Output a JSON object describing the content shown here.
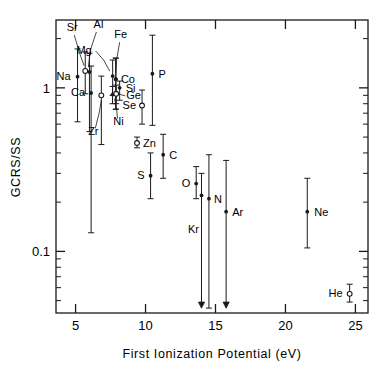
{
  "figure": {
    "domain": "chart",
    "background_color": "#ffffff",
    "ink_color": "#1a1a1a"
  },
  "chart_data": {
    "type": "scatter",
    "title": "",
    "xlabel": "First Ionization Potential (eV)",
    "ylabel": "GCRS/SS",
    "xscale": "linear",
    "yscale": "log",
    "xlim": [
      3.6,
      25.9
    ],
    "ylim": [
      0.042,
      2.6
    ],
    "xticks": [
      5,
      10,
      15,
      20,
      25
    ],
    "xtick_labels": [
      "5",
      "10",
      "15",
      "20",
      "25"
    ],
    "yticks": [
      1,
      0.1
    ],
    "ytick_labels": [
      "1",
      "0.1"
    ],
    "yminor_decades": [
      1,
      0.1
    ],
    "grid": false,
    "legend": false,
    "error_bars": "vertical",
    "points": [
      {
        "label": "Na",
        "x": 5.14,
        "y": 1.17,
        "ylo": 0.62,
        "yhi": 1.73,
        "marker": "filled",
        "label_pos": "left"
      },
      {
        "label": "Sr",
        "x": 5.69,
        "y": 1.27,
        "ylo": 0.92,
        "yhi": 1.66,
        "marker": "open",
        "label_pos": "leader-up-left"
      },
      {
        "label": "Al",
        "x": 5.99,
        "y": 1.25,
        "ylo": 0.54,
        "yhi": 1.63,
        "marker": "filled",
        "label_pos": "leader-up"
      },
      {
        "label": "Ca",
        "x": 6.11,
        "y": 0.93,
        "ylo": 0.13,
        "yhi": 1.36,
        "marker": "filled",
        "label_pos": "left"
      },
      {
        "label": "Mg",
        "x": 7.65,
        "y": 1.18,
        "ylo": 0.9,
        "yhi": 1.48,
        "marker": "filled",
        "label_pos": "leader-left"
      },
      {
        "label": "Zr",
        "x": 6.84,
        "y": 0.9,
        "ylo": 0.45,
        "yhi": 1.18,
        "marker": "open",
        "label_pos": "leader-down-left"
      },
      {
        "label": "Fe",
        "x": 7.87,
        "y": 1.13,
        "ylo": 0.74,
        "yhi": 1.52,
        "marker": "filled",
        "label_pos": "leader-up"
      },
      {
        "label": "Co",
        "x": 7.88,
        "y": 1.13,
        "ylo": 0.74,
        "yhi": 1.52,
        "marker": "filled",
        "label_pos": "right"
      },
      {
        "label": "Si",
        "x": 8.15,
        "y": 1.0,
        "ylo": 0.84,
        "yhi": 1.1,
        "marker": "filled",
        "label_pos": "right"
      },
      {
        "label": "Ni",
        "x": 7.64,
        "y": 0.91,
        "ylo": 0.8,
        "yhi": 1.02,
        "marker": "filled",
        "label_pos": "leader-down"
      },
      {
        "label": "Ge",
        "x": 7.9,
        "y": 0.92,
        "ylo": 0.8,
        "yhi": 1.04,
        "marker": "open",
        "label_pos": "leader-right"
      },
      {
        "label": "Se",
        "x": 9.75,
        "y": 0.78,
        "ylo": 0.6,
        "yhi": 0.97,
        "marker": "open",
        "label_pos": "left"
      },
      {
        "label": "Zn",
        "x": 9.39,
        "y": 0.46,
        "ylo": 0.43,
        "yhi": 0.5,
        "marker": "open",
        "label_pos": "right"
      },
      {
        "label": "P",
        "x": 10.49,
        "y": 1.22,
        "ylo": 0.59,
        "yhi": 2.1,
        "marker": "filled",
        "label_pos": "right"
      },
      {
        "label": "C",
        "x": 11.26,
        "y": 0.39,
        "ylo": 0.28,
        "yhi": 0.52,
        "marker": "filled",
        "label_pos": "right"
      },
      {
        "label": "S",
        "x": 10.36,
        "y": 0.29,
        "ylo": 0.21,
        "yhi": 0.4,
        "marker": "filled",
        "label_pos": "left"
      },
      {
        "label": "O",
        "x": 13.62,
        "y": 0.26,
        "ylo": 0.21,
        "yhi": 0.33,
        "marker": "filled",
        "label_pos": "left"
      },
      {
        "label": "N",
        "x": 14.53,
        "y": 0.21,
        "ylo": 0.045,
        "yhi": 0.39,
        "marker": "filled",
        "label_pos": "right"
      },
      {
        "label": "Kr",
        "x": 14.0,
        "y": 0.22,
        "ylo": 0.045,
        "yhi": 0.3,
        "marker": "arrow-down",
        "label_pos": "leader-down-left"
      },
      {
        "label": "Ar",
        "x": 15.76,
        "y": 0.175,
        "ylo": 0.045,
        "yhi": 0.36,
        "marker": "arrow-down",
        "label_pos": "right"
      },
      {
        "label": "Ne",
        "x": 21.56,
        "y": 0.175,
        "ylo": 0.105,
        "yhi": 0.28,
        "marker": "filled",
        "label_pos": "right"
      },
      {
        "label": "He",
        "x": 24.59,
        "y": 0.055,
        "ylo": 0.049,
        "yhi": 0.063,
        "marker": "open",
        "label_pos": "left"
      }
    ]
  }
}
